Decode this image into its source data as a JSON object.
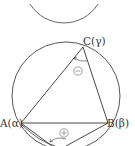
{
  "diagram": {
    "type": "inscribed-triangle-geometry",
    "points": {
      "A": {
        "label": "A(α)",
        "x": 20,
        "y": 123
      },
      "B": {
        "label": "B(β)",
        "x": 108,
        "y": 123
      },
      "C": {
        "label": "C(γ)",
        "x": 83,
        "y": 47
      },
      "D": {
        "x": 58,
        "y": 147
      }
    },
    "circle": {
      "cx": 66,
      "cy": 96,
      "r": 54
    },
    "top_arc": {
      "cx": 64,
      "cy": -28,
      "r": 40
    },
    "angle_marks": [
      {
        "at": "C",
        "sign": "−",
        "x": 78,
        "y": 70
      },
      {
        "at": "D",
        "sign": "+",
        "x": 64,
        "y": 133
      }
    ],
    "colors": {
      "stroke": "#444444",
      "text": "#333333",
      "sign": "#666666"
    }
  }
}
